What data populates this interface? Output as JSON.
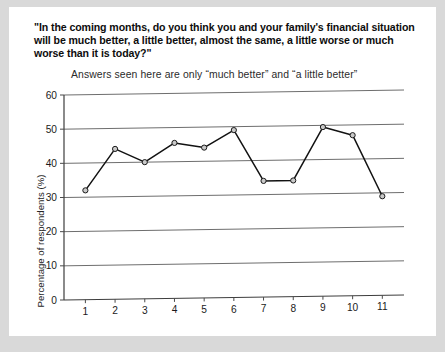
{
  "question_title": "\"In the coming months, do you think you and your family's financial situation will be much better, a little better, almost the same, a little worse or much worse than it is today?\"",
  "chart_data": {
    "type": "line",
    "title": "",
    "subtitle": "Answers seen here are only “much better” and “a little better”",
    "xlabel": "",
    "ylabel": "Percentage of respondents (%)",
    "categories": [
      "1",
      "2",
      "3",
      "4",
      "5",
      "6",
      "7",
      "8",
      "9",
      "10",
      "11"
    ],
    "values": [
      32,
      44,
      40,
      45.5,
      44,
      49,
      34,
      34,
      49.5,
      47,
      29
    ],
    "ylim": [
      0,
      60
    ],
    "yticks": [
      "0",
      "10",
      "20",
      "30",
      "40",
      "50",
      "60"
    ],
    "ytick_values": [
      0,
      10,
      20,
      30,
      40,
      50,
      60
    ],
    "grid": true,
    "legend": "none",
    "marker": "circle",
    "line_color": "#121212",
    "marker_fill": "#c9c9c9",
    "gridline_color": "#6e6e6e"
  }
}
